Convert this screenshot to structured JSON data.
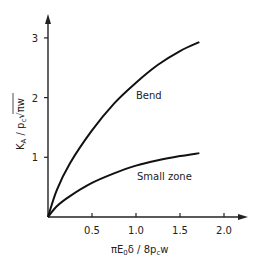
{
  "chart_data": {
    "type": "line",
    "title": "",
    "xlabel": "πE₀δ / 8p꜀w",
    "ylabel": "K_A / p_c √(πw)",
    "xlim": [
      0,
      2.1
    ],
    "ylim": [
      0,
      3.2
    ],
    "x_ticks": [
      "0.5",
      "1.0",
      "1.5",
      "2.0"
    ],
    "y_ticks": [
      "1",
      "2",
      "3"
    ],
    "grid": false,
    "legend": "inline labels",
    "series": [
      {
        "name": "Bend",
        "x": [
          0,
          0.1,
          0.25,
          0.5,
          0.75,
          1.0,
          1.25,
          1.5,
          1.72
        ],
        "y": [
          0,
          0.45,
          0.9,
          1.45,
          1.9,
          2.25,
          2.55,
          2.78,
          2.93
        ]
      },
      {
        "name": "Small zone",
        "x": [
          0,
          0.1,
          0.25,
          0.5,
          0.75,
          1.0,
          1.25,
          1.5,
          1.72
        ],
        "y": [
          0,
          0.18,
          0.35,
          0.57,
          0.73,
          0.86,
          0.95,
          1.02,
          1.07
        ]
      }
    ]
  },
  "labels": {
    "xlabel_html": "πE₀δ / 8p꜀w",
    "ylabel": "K_A / p_c √πw",
    "bend": "Bend",
    "small_zone": "Small zone"
  }
}
